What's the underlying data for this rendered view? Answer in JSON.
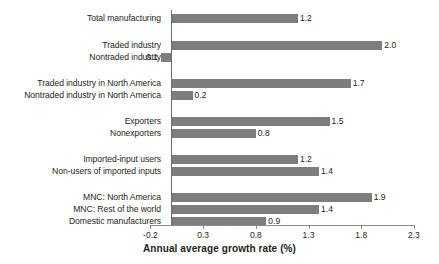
{
  "chart_data": {
    "type": "bar",
    "orientation": "horizontal",
    "title": "",
    "xlabel": "Annual average growth rate (%)",
    "ylabel": "",
    "xlim": [
      -0.2,
      2.3
    ],
    "xticks": [
      "-0.2",
      "0.3",
      "0.8",
      "1.3",
      "1.8",
      "2.3"
    ],
    "xtick_values": [
      -0.2,
      0.3,
      0.8,
      1.3,
      1.8,
      2.3
    ],
    "grid": false,
    "legend": false,
    "bar_color": "#7d7d7d",
    "categories": [
      "Total manufacturing",
      "Traded industry",
      "Nontraded industry",
      "Traded industry in North America",
      "Nontraded industry in North America",
      "Exporters",
      "Nonexporters",
      "Imported-input users",
      "Non-users of imported inputs",
      "MNC: North America",
      "MNC: Rest of the world",
      "Domestic manufacturers"
    ],
    "values": [
      1.2,
      2.0,
      -0.1,
      1.7,
      0.2,
      1.5,
      0.8,
      1.2,
      1.4,
      1.9,
      1.4,
      0.9
    ],
    "value_labels": [
      "1.2",
      "2.0",
      "0.1",
      "1.7",
      "0.2",
      "1.5",
      "0.8",
      "1.2",
      "1.4",
      "1.9",
      "1.4",
      "0.9"
    ],
    "groups": [
      {
        "name": "total",
        "categories": [
          "Total manufacturing"
        ]
      },
      {
        "name": "traded",
        "categories": [
          "Traded industry",
          "Nontraded industry"
        ]
      },
      {
        "name": "north-america",
        "categories": [
          "Traded industry in North America",
          "Nontraded industry in North America"
        ]
      },
      {
        "name": "exporting",
        "categories": [
          "Exporters",
          "Nonexporters"
        ]
      },
      {
        "name": "imported-inputs",
        "categories": [
          "Imported-input users",
          "Non-users of imported inputs"
        ]
      },
      {
        "name": "ownership",
        "categories": [
          "MNC: North America",
          "MNC: Rest of the world",
          "Domestic manufacturers"
        ]
      }
    ],
    "rows": [
      {
        "label": "Total manufacturing",
        "value": 1.2,
        "value_label": "1.2",
        "y": 14,
        "group": 0
      },
      {
        "label": "Traded industry",
        "value": 2.0,
        "value_label": "2.0",
        "y": 41,
        "group": 1
      },
      {
        "label": "Nontraded industry",
        "value": -0.1,
        "value_label": "0.1",
        "y": 53,
        "group": 1
      },
      {
        "label": "Traded industry in North America",
        "value": 1.7,
        "value_label": "1.7",
        "y": 79,
        "group": 2
      },
      {
        "label": "Nontraded industry in North America",
        "value": 0.2,
        "value_label": "0.2",
        "y": 91,
        "group": 2
      },
      {
        "label": "Exporters",
        "value": 1.5,
        "value_label": "1.5",
        "y": 117,
        "group": 3
      },
      {
        "label": "Nonexporters",
        "value": 0.8,
        "value_label": "0.8",
        "y": 129,
        "group": 3
      },
      {
        "label": "Imported-input users",
        "value": 1.2,
        "value_label": "1.2",
        "y": 155,
        "group": 4
      },
      {
        "label": "Non-users of imported inputs",
        "value": 1.4,
        "value_label": "1.4",
        "y": 167,
        "group": 4
      },
      {
        "label": "MNC: North America",
        "value": 1.9,
        "value_label": "1.9",
        "y": 193,
        "group": 5
      },
      {
        "label": "MNC: Rest of the world",
        "value": 1.4,
        "value_label": "1.4",
        "y": 205,
        "group": 5
      },
      {
        "label": "Domestic manufacturers",
        "value": 0.9,
        "value_label": "0.9",
        "y": 217,
        "group": 5
      }
    ]
  }
}
